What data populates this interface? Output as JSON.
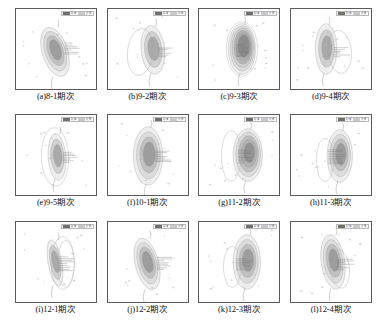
{
  "figure": {
    "type": "multi-panel-contour-map-grid",
    "rows": 3,
    "columns": 4,
    "panel_count": 12,
    "colors": {
      "fill_dark": "#8c8c8c",
      "fill_mid": "#a9a9a9",
      "fill_light": "#c6c6c6",
      "contour_line": "#9a9a9a",
      "outline_line": "#b0b0b0",
      "frame": "#5a5a5a",
      "well_point": "#9e9e9e",
      "label_text": "#111111",
      "background": "#ffffff"
    },
    "legend": {
      "swatch_dark_label": "砂体",
      "swatch_light_label": "边界"
    },
    "panels": [
      {
        "id": "a",
        "caption": "(a)8-1期次",
        "label": "8-1",
        "stage": "期次",
        "shape": "tilted-lobe",
        "lobe_cx": 40,
        "lobe_cy": 44,
        "lobe_rx": 13,
        "lobe_ry": 26,
        "lobe_rotate": -18,
        "rings": 4,
        "outline": "none",
        "outline_cx": 0,
        "outline_cy": 0,
        "outline_rx": 0,
        "outline_ry": 0,
        "outline_rotate": 0,
        "leaders": 7,
        "leader_x": 50,
        "leader_y": 40
      },
      {
        "id": "b",
        "caption": "(b)9-2期次",
        "label": "9-2",
        "stage": "期次",
        "shape": "vertical-lobe-right",
        "lobe_cx": 46,
        "lobe_cy": 42,
        "lobe_rx": 12,
        "lobe_ry": 25,
        "lobe_rotate": -6,
        "rings": 3,
        "outline": "left-loop",
        "outline_cx": 33,
        "outline_cy": 44,
        "outline_rx": 13,
        "outline_ry": 24,
        "outline_rotate": 6,
        "leaders": 6,
        "leader_x": 52,
        "leader_y": 44
      },
      {
        "id": "c",
        "caption": "(c)9-3期次",
        "label": "9-3",
        "stage": "期次",
        "shape": "concentric-rings",
        "lobe_cx": 44,
        "lobe_cy": 41,
        "lobe_rx": 14,
        "lobe_ry": 26,
        "lobe_rotate": 0,
        "rings": 7,
        "outline": "rings-only",
        "outline_cx": 44,
        "outline_cy": 41,
        "outline_rx": 16,
        "outline_ry": 28,
        "outline_rotate": 0,
        "leaders": 8,
        "leader_x": 38,
        "leader_y": 42
      },
      {
        "id": "d",
        "caption": "(d)9-4期次",
        "label": "9-4",
        "stage": "期次",
        "shape": "vertical-lobe-left",
        "lobe_cx": 36,
        "lobe_cy": 41,
        "lobe_rx": 11,
        "lobe_ry": 26,
        "lobe_rotate": 0,
        "rings": 3,
        "outline": "right-loop",
        "outline_cx": 50,
        "outline_cy": 44,
        "outline_rx": 12,
        "outline_ry": 22,
        "outline_rotate": -5,
        "leaders": 6,
        "leader_x": 44,
        "leader_y": 44
      },
      {
        "id": "e",
        "caption": "(e)9-5期次",
        "label": "9-5",
        "stage": "期次",
        "shape": "narrow-lobe",
        "lobe_cx": 42,
        "lobe_cy": 43,
        "lobe_rx": 9,
        "lobe_ry": 24,
        "lobe_rotate": -4,
        "rings": 3,
        "outline": "surround",
        "outline_cx": 40,
        "outline_cy": 43,
        "outline_rx": 14,
        "outline_ry": 30,
        "outline_rotate": -2,
        "leaders": 7,
        "leader_x": 48,
        "leader_y": 43
      },
      {
        "id": "f",
        "caption": "(f)10-1期次",
        "label": "10-1",
        "stage": "期次",
        "shape": "broad-lobe",
        "lobe_cx": 41,
        "lobe_cy": 42,
        "lobe_rx": 15,
        "lobe_ry": 30,
        "lobe_rotate": 0,
        "rings": 4,
        "outline": "none",
        "outline_cx": 0,
        "outline_cy": 0,
        "outline_rx": 0,
        "outline_ry": 0,
        "outline_rotate": 0,
        "leaders": 7,
        "leader_x": 48,
        "leader_y": 42
      },
      {
        "id": "g",
        "caption": "(g)11-2期次",
        "label": "11-2",
        "stage": "期次",
        "shape": "right-heavy-lobe",
        "lobe_cx": 50,
        "lobe_cy": 41,
        "lobe_rx": 15,
        "lobe_ry": 27,
        "lobe_rotate": 0,
        "rings": 5,
        "outline": "left-loop",
        "outline_cx": 33,
        "outline_cy": 42,
        "outline_rx": 10,
        "outline_ry": 26,
        "outline_rotate": 0,
        "leaders": 8,
        "leader_x": 40,
        "leader_y": 42
      },
      {
        "id": "h",
        "caption": "(h)11-3期次",
        "label": "11-3",
        "stage": "期次",
        "shape": "right-lobe",
        "lobe_cx": 50,
        "lobe_cy": 42,
        "lobe_rx": 13,
        "lobe_ry": 27,
        "lobe_rotate": 0,
        "rings": 4,
        "outline": "left-loop",
        "outline_cx": 35,
        "outline_cy": 46,
        "outline_rx": 9,
        "outline_ry": 22,
        "outline_rotate": 0,
        "leaders": 9,
        "leader_x": 38,
        "leader_y": 42
      },
      {
        "id": "i",
        "caption": "(i)12-1期次",
        "label": "12-1",
        "stage": "期次",
        "shape": "thin-tilted-lobe",
        "lobe_cx": 40,
        "lobe_cy": 42,
        "lobe_rx": 7,
        "lobe_ry": 24,
        "lobe_rotate": -10,
        "rings": 3,
        "outline": "double-loop",
        "outline_cx": 48,
        "outline_cy": 42,
        "outline_rx": 12,
        "outline_ry": 27,
        "outline_rotate": 0,
        "leaders": 9,
        "leader_x": 44,
        "leader_y": 42
      },
      {
        "id": "j",
        "caption": "(j)12-2期次",
        "label": "12-2",
        "stage": "期次",
        "shape": "tilted-lobe",
        "lobe_cx": 40,
        "lobe_cy": 43,
        "lobe_rx": 12,
        "lobe_ry": 27,
        "lobe_rotate": -14,
        "rings": 4,
        "outline": "none",
        "outline_cx": 0,
        "outline_cy": 0,
        "outline_rx": 0,
        "outline_ry": 0,
        "outline_rotate": 0,
        "leaders": 8,
        "leader_x": 50,
        "leader_y": 42
      },
      {
        "id": "k",
        "caption": "(k)12-3期次",
        "label": "12-3",
        "stage": "期次",
        "shape": "right-lobe",
        "lobe_cx": 49,
        "lobe_cy": 41,
        "lobe_rx": 14,
        "lobe_ry": 28,
        "lobe_rotate": 0,
        "rings": 4,
        "outline": "left-loop",
        "outline_cx": 34,
        "outline_cy": 46,
        "outline_rx": 9,
        "outline_ry": 21,
        "outline_rotate": 0,
        "leaders": 7,
        "leader_x": 38,
        "leader_y": 43
      },
      {
        "id": "l",
        "caption": "(l)12-4期次",
        "label": "12-4",
        "stage": "期次",
        "shape": "tilted-lobe-right-loop",
        "lobe_cx": 43,
        "lobe_cy": 41,
        "lobe_rx": 12,
        "lobe_ry": 28,
        "lobe_rotate": -8,
        "rings": 4,
        "outline": "right-loop",
        "outline_cx": 50,
        "outline_cy": 48,
        "outline_rx": 10,
        "outline_ry": 20,
        "outline_rotate": -6,
        "leaders": 7,
        "leader_x": 47,
        "leader_y": 43
      }
    ]
  }
}
